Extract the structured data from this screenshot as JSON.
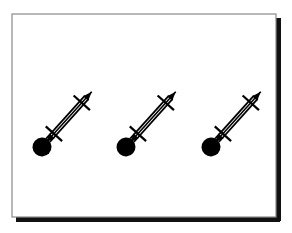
{
  "figure": {
    "title": "Three identical pendulum-rod schematic symbols",
    "caption": "",
    "background_color": "#ffffff",
    "ink_color": "#000000",
    "canvas": {
      "width": 292,
      "height": 233
    }
  },
  "frame": {
    "name": "bordered-panel",
    "x": 12,
    "y": 14,
    "width": 264,
    "height": 203,
    "fill": "#ffffff",
    "thin_border_color": "#8a8a8a",
    "thin_border_width": 1.2,
    "shadow_color": "#111111",
    "shadow_offset_x": 4,
    "shadow_offset_y": 4,
    "shadow_thickness": 5
  },
  "symbols": [
    {
      "id": "symbol-1",
      "label": "Pendulum symbol 1",
      "bob_center_x": 42,
      "bob_center_y": 147,
      "bob_radius": 9.5,
      "tip_x": 92,
      "tip_y": 92
    },
    {
      "id": "symbol-2",
      "label": "Pendulum symbol 2",
      "bob_center_x": 126,
      "bob_center_y": 147,
      "bob_radius": 9.5,
      "tip_x": 176,
      "tip_y": 92
    },
    {
      "id": "symbol-3",
      "label": "Pendulum symbol 3",
      "bob_center_x": 211,
      "bob_center_y": 147,
      "bob_radius": 9.5,
      "tip_x": 261,
      "tip_y": 92
    }
  ],
  "symbol_geometry": {
    "description": "Filled circular bob at lower-left; a pair of parallel rails running up-right at about 48 degrees; a double-headed arrow running inside/alongside the rails pointing down-left into the bob and up-right past the rails; two perpendicular cross-bars (hatch ticks) crossing the rails near the lower and upper ends.",
    "rail_angle_deg": -48,
    "rail_gap": 5.0,
    "rail_stroke": 1.8,
    "arrow_stroke": 1.6,
    "crossbar_stroke": 2.2,
    "crossbar_half_length": 11,
    "lower_crossbar_t": 0.24,
    "upper_crossbar_t": 0.8,
    "arrowhead_length": 9,
    "arrowhead_half_width": 3.4
  },
  "legend": {
    "visible": false,
    "entries": []
  },
  "annotations": []
}
